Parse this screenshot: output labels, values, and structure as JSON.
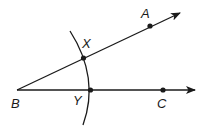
{
  "diagram": {
    "type": "angle-construction",
    "stroke_color": "#1a1a1a",
    "background": "#ffffff",
    "vertex": {
      "label": "B",
      "x": 17,
      "y": 90
    },
    "rays": [
      {
        "name": "ray-BA",
        "from": "B",
        "through": "A",
        "end": {
          "x": 180,
          "y": 13
        }
      },
      {
        "name": "ray-BC",
        "from": "B",
        "through": "C",
        "end": {
          "x": 195,
          "y": 90
        }
      }
    ],
    "points": [
      {
        "label": "A",
        "x": 150,
        "y": 26
      },
      {
        "label": "X",
        "x": 83,
        "y": 58
      },
      {
        "label": "Y",
        "x": 90,
        "y": 90
      },
      {
        "label": "C",
        "x": 163,
        "y": 90
      }
    ],
    "arc": {
      "center": "B",
      "start": {
        "x": 70,
        "y": 31
      },
      "end": {
        "x": 83,
        "y": 125
      }
    },
    "labels": {
      "A": "A",
      "B": "B",
      "C": "C",
      "X": "X",
      "Y": "Y"
    }
  }
}
